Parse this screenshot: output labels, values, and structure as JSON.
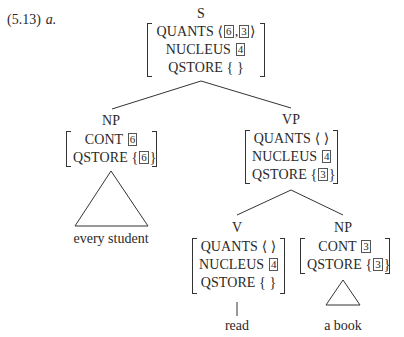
{
  "example": {
    "number": "(5.13)",
    "sub": "a."
  },
  "tree": {
    "S": {
      "label": "S",
      "rows": [
        {
          "attr": "QUANTS",
          "open": "⟨",
          "tags": [
            "6",
            "3"
          ],
          "sep": ",",
          "close": "⟩"
        },
        {
          "attr": "NUCLEUS",
          "tag": "4"
        },
        {
          "attr": "QSTORE",
          "value": "{ }"
        }
      ]
    },
    "NP1": {
      "label": "NP",
      "rows": [
        {
          "attr": "CONT",
          "tag": "6"
        },
        {
          "attr": "QSTORE",
          "open": "{",
          "tag": "6",
          "close": "}"
        }
      ],
      "leaf": "every student"
    },
    "VP": {
      "label": "VP",
      "rows": [
        {
          "attr": "QUANTS",
          "value": "⟨ ⟩"
        },
        {
          "attr": "NUCLEUS",
          "tag": "4"
        },
        {
          "attr": "QSTORE",
          "open": "{",
          "tag": "3",
          "close": "}"
        }
      ]
    },
    "V": {
      "label": "V",
      "rows": [
        {
          "attr": "QUANTS",
          "value": "⟨ ⟩"
        },
        {
          "attr": "NUCLEUS",
          "tag": "4"
        },
        {
          "attr": "QSTORE",
          "value": "{ }"
        }
      ],
      "leaf": "read"
    },
    "NP2": {
      "label": "NP",
      "rows": [
        {
          "attr": "CONT",
          "tag": "3"
        },
        {
          "attr": "QSTORE",
          "open": "{",
          "tag": "3",
          "close": "}"
        }
      ],
      "leaf": "a book"
    }
  }
}
